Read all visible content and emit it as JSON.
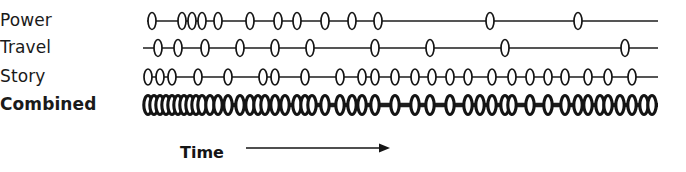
{
  "figure": {
    "width": 686,
    "height": 172,
    "background": "#ffffff",
    "ink_color": "#1a1a1a"
  },
  "axis": {
    "caption": "Time",
    "caption_x": 180,
    "caption_y": 152,
    "arrow_start_x": 246,
    "arrow_end_x": 390,
    "arrow_y": 148
  },
  "chart_data": {
    "type": "timeline",
    "title": "",
    "xlabel": "Time",
    "ylabel": "",
    "grid": false,
    "legend": "none",
    "axis_range_px": [
      145,
      658
    ],
    "note": "Event-occurrence timelines; each marker is a discrete event. Combined row is the union of the three source rows and is drawn with a heavier stroke.",
    "categories": [
      "Power",
      "Travel",
      "Story",
      "Combined"
    ],
    "series": [
      {
        "name": "Power",
        "bold": false,
        "line_y": 21,
        "line_start": 147,
        "line_end": 658,
        "marker_rx": 4.0,
        "marker_ry": 8.5,
        "stroke": "thin",
        "event_count": 13,
        "events": [
          152,
          182,
          192,
          202,
          218,
          250,
          278,
          297,
          325,
          352,
          378,
          490,
          578
        ]
      },
      {
        "name": "Travel",
        "bold": false,
        "line_y": 48,
        "line_start": 143,
        "line_end": 658,
        "marker_rx": 4.0,
        "marker_ry": 8.5,
        "stroke": "thin",
        "event_count": 10,
        "events": [
          158,
          178,
          205,
          240,
          275,
          310,
          375,
          430,
          505,
          625
        ]
      },
      {
        "name": "Story",
        "bold": false,
        "line_y": 77,
        "line_start": 144,
        "line_end": 658,
        "marker_rx": 4.0,
        "marker_ry": 8.0,
        "stroke": "thin",
        "event_count": 24,
        "events": [
          148,
          160,
          172,
          198,
          228,
          263,
          275,
          305,
          340,
          362,
          375,
          395,
          415,
          432,
          450,
          468,
          492,
          512,
          530,
          548,
          565,
          588,
          608,
          632
        ]
      },
      {
        "name": "Combined",
        "bold": true,
        "line_y": 105,
        "line_start": 144,
        "line_end": 658,
        "marker_rx": 4.2,
        "marker_ry": 9.5,
        "stroke": "thick",
        "event_count": 47,
        "events": [
          148,
          154,
          160,
          166,
          172,
          178,
          184,
          190,
          196,
          202,
          210,
          218,
          228,
          240,
          250,
          258,
          265,
          275,
          285,
          297,
          305,
          312,
          325,
          340,
          352,
          362,
          375,
          395,
          415,
          430,
          450,
          468,
          480,
          492,
          505,
          512,
          530,
          548,
          565,
          578,
          588,
          600,
          608,
          620,
          632,
          644,
          652
        ]
      }
    ]
  },
  "rows": [
    {
      "label": "Power",
      "label_y": 10,
      "bold": false
    },
    {
      "label": "Travel",
      "label_y": 37,
      "bold": false
    },
    {
      "label": "Story",
      "label_y": 66,
      "bold": false
    },
    {
      "label": "Combined",
      "label_y": 94,
      "bold": true
    }
  ]
}
